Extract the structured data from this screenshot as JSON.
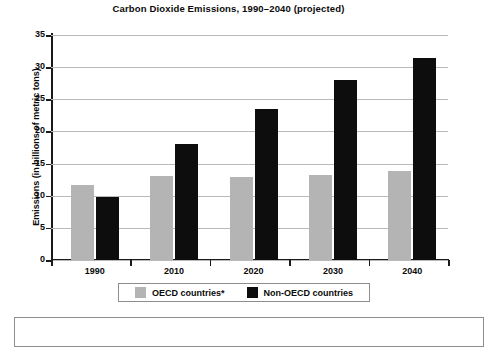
{
  "chart_data": {
    "type": "bar",
    "title": "Carbon Dioxide Emissions, 1990–2040 (projected)",
    "xlabel": "",
    "ylabel": "Emissions (in billions of metric tons)",
    "categories": [
      "1990",
      "2010",
      "2020",
      "2030",
      "2040"
    ],
    "series": [
      {
        "name": "OECD countries*",
        "color": "#b4b4b4",
        "values": [
          11.6,
          13.0,
          12.9,
          13.3,
          13.9
        ]
      },
      {
        "name": "Non-OECD countries",
        "color": "#0d0d0d",
        "values": [
          9.8,
          18.0,
          23.5,
          28.0,
          31.5
        ]
      }
    ],
    "ylim": [
      0,
      35
    ],
    "yticks": [
      "0",
      "5",
      "10",
      "15",
      "20",
      "25",
      "30",
      "35"
    ],
    "ytick_values": [
      0,
      5,
      10,
      15,
      20,
      25,
      30,
      35
    ],
    "grid": true,
    "legend_position": "bottom"
  },
  "legend": {
    "items": [
      {
        "label": "OECD countries*",
        "swatch": "gray-swatch"
      },
      {
        "label": "Non-OECD countries",
        "swatch": "black-swatch"
      }
    ]
  }
}
